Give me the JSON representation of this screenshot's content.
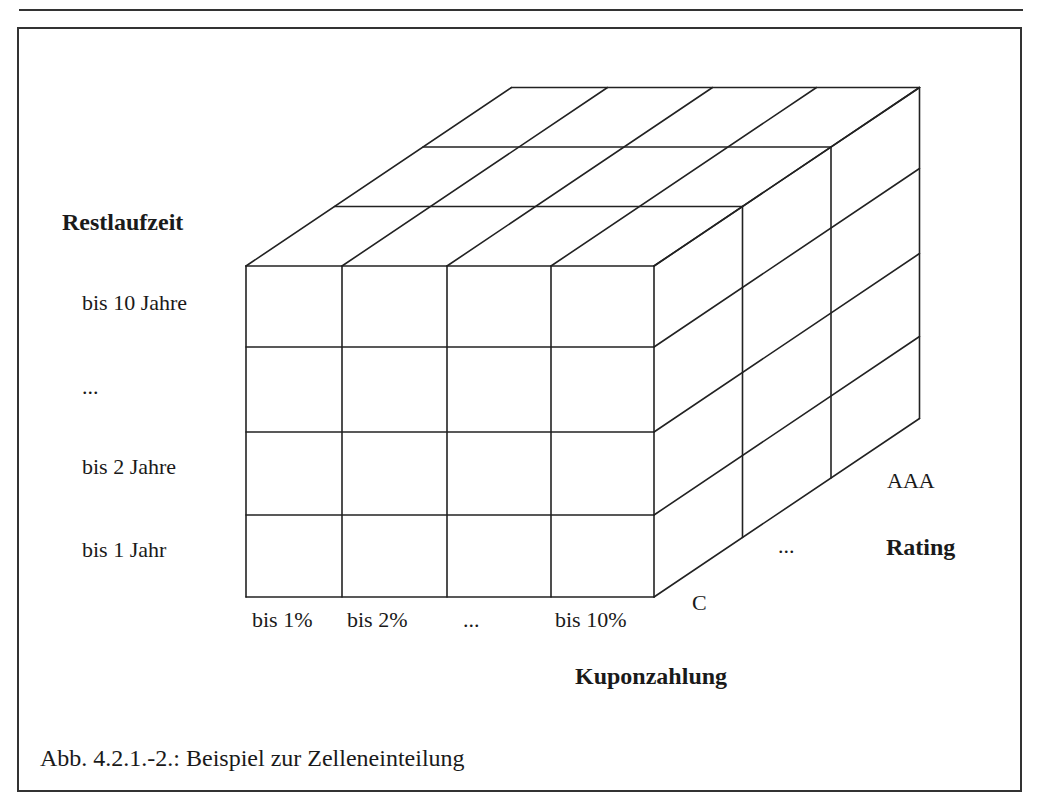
{
  "figure": {
    "caption": "Abb. 4.2.1.-2.: Beispiel zur Zelleneinteilung",
    "stroke_color": "#222222",
    "background": "#ffffff"
  },
  "axes": {
    "vertical": {
      "title": "Restlaufzeit",
      "ticks": [
        "bis 10 Jahre",
        "...",
        "bis 2 Jahre",
        "bis 1 Jahr"
      ]
    },
    "horizontal": {
      "title": "Kuponzahlung",
      "ticks": [
        "bis 1%",
        "bis 2%",
        "...",
        "bis 10%"
      ]
    },
    "depth": {
      "title": "Rating",
      "ticks": [
        "C",
        "...",
        "AAA"
      ]
    }
  },
  "cube": {
    "columns": 4,
    "rows": 4,
    "layers": 3,
    "front_x": [
      246,
      342,
      447,
      551,
      654
    ],
    "front_y": [
      266,
      347,
      432,
      515,
      597
    ],
    "depth_dx": 88.5,
    "depth_dy": -59.5
  }
}
